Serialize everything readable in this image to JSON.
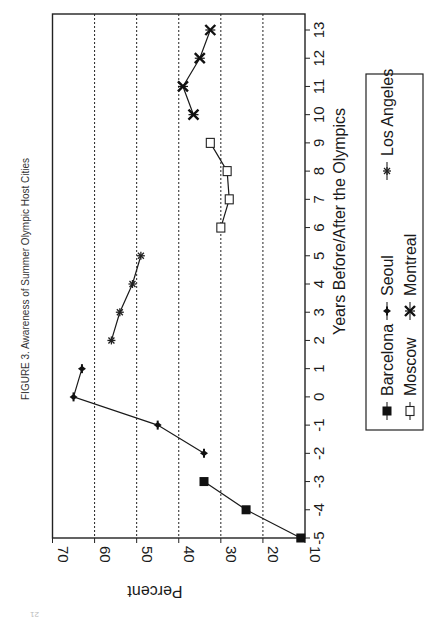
{
  "figure": {
    "title": "FIGURE 3. Awareness of Summer Olympic Host Cities",
    "orientation": "rotated 90 degrees counter-clockwise",
    "page_mark": "21"
  },
  "chart_data": {
    "type": "line",
    "title": "FIGURE 3. Awareness of Summer Olympic Host Cities",
    "xlabel": "Years Before/After the Olympics",
    "ylabel": "Percent",
    "xlim": [
      -5,
      13
    ],
    "ylim": [
      10,
      70
    ],
    "x_ticks": [
      "-5",
      "-4",
      "-3",
      "-2",
      "-1",
      "0",
      "1",
      "2",
      "3",
      "4",
      "5",
      "6",
      "7",
      "8",
      "9",
      "10",
      "11",
      "12",
      "13"
    ],
    "y_ticks": [
      "10",
      "20",
      "30",
      "40",
      "50",
      "60",
      "70"
    ],
    "grid": "horizontal dotted at 20,30,40,50,60",
    "legend_position": "below plot (right side when rotated)",
    "series": [
      {
        "name": "Barcelona",
        "marker": "filled-square",
        "x": [
          -5,
          -4,
          -3
        ],
        "y": [
          11,
          24,
          34
        ]
      },
      {
        "name": "Seoul",
        "marker": "filled-diamond",
        "x": [
          -2,
          -1,
          0,
          1
        ],
        "y": [
          34,
          45,
          65,
          63
        ]
      },
      {
        "name": "Los Angeles",
        "marker": "asterisk",
        "x": [
          2,
          3,
          4,
          5
        ],
        "y": [
          56,
          54,
          51,
          49
        ]
      },
      {
        "name": "Moscow",
        "marker": "open-square",
        "x": [
          6,
          7,
          8,
          9
        ],
        "y": [
          30,
          28,
          28.5,
          32.5
        ]
      },
      {
        "name": "Montreal",
        "marker": "bowtie-x",
        "x": [
          10,
          11,
          12,
          13
        ],
        "y": [
          36.5,
          39,
          35,
          32.5
        ]
      }
    ]
  },
  "legend": {
    "items": [
      {
        "label": "Barcelona",
        "marker": "filled-square-icon"
      },
      {
        "label": "Seoul",
        "marker": "filled-diamond-icon"
      },
      {
        "label": "Los Angeles",
        "marker": "asterisk-icon"
      },
      {
        "label": "Moscow",
        "marker": "open-square-icon"
      },
      {
        "label": "Montreal",
        "marker": "bowtie-x-icon"
      }
    ]
  },
  "colors": {
    "ink": "#1a1a1a",
    "background": "#ffffff"
  }
}
